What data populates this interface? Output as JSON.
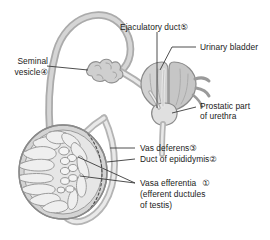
{
  "figure": {
    "type": "anatomical-line-diagram",
    "background_color": "#ffffff",
    "line_color": "#7d7d7d",
    "text_color": "#1b1b1b",
    "fill_light": "#e3e3e3",
    "fill_mid": "#cfcfcf",
    "fill_dark": "#bcbcbc"
  },
  "labels": {
    "ejaculatory_duct": "Ejaculatory duct ⓪",
    "ejaculatory_duct_text": "Ejaculatory duct",
    "ejaculatory_duct_num": "⑤",
    "urinary_bladder": "Urinary bladder",
    "seminal_vesicle_line1": "Seminal",
    "seminal_vesicle_line2": "vesicle",
    "seminal_vesicle_num": "④",
    "prostatic_part_line1": "Prostatic part",
    "prostatic_part_line2": "of urethra",
    "vas_deferens": "Vas deferens",
    "vas_deferens_num": "③",
    "duct_of_epididymis": "Duct of epididymis",
    "duct_of_epididymis_num": "②",
    "vasa_efferentia": "Vasa efferentia",
    "vasa_efferentia_num": "①",
    "vasa_efferentia_sub1": "(efferent ductules",
    "vasa_efferentia_sub2": "of testis)"
  },
  "structures": [
    {
      "name": "testis",
      "label_ref": "vasa_efferentia"
    },
    {
      "name": "epididymis",
      "label_ref": "duct_of_epididymis"
    },
    {
      "name": "vas-deferens",
      "label_ref": "vas_deferens"
    },
    {
      "name": "seminal-vesicle",
      "label_ref": "seminal_vesicle_line1"
    },
    {
      "name": "urinary-bladder",
      "label_ref": "urinary_bladder"
    },
    {
      "name": "ejaculatory-duct",
      "label_ref": "ejaculatory_duct_text"
    },
    {
      "name": "prostate-urethra",
      "label_ref": "prostatic_part_line1"
    }
  ]
}
